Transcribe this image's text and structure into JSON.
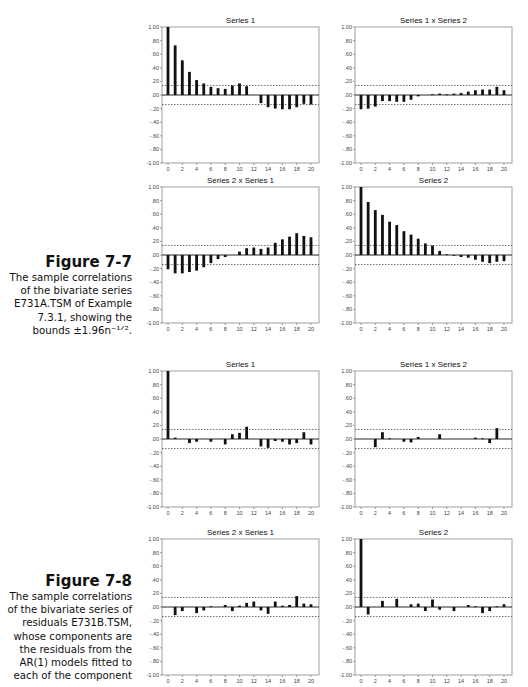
{
  "figures": [
    {
      "label": "Figure 7-7",
      "caption_lines": [
        "The sample correlations",
        "of the bivariate series",
        "E731A.TSM of Example",
        "7.3.1, showing the",
        "bounds ±1.96n⁻¹ᐟ²."
      ],
      "caption_text": "The sample correlations of the bivariate series E731A.TSM of Example 7.3.1, showing the bounds ±1.96n^(-1/2)."
    },
    {
      "label": "Figure 7-8",
      "caption_lines": [
        "The sample correlations",
        "of the bivariate series of",
        "residuals E731B.TSM,",
        "whose components are",
        "the residuals from the",
        "AR(1) models fitted to",
        "each of the component"
      ],
      "caption_text": "The sample correlations of the bivariate series of residuals E731B.TSM, whose components are the residuals from the AR(1) models fitted to each of the component"
    }
  ],
  "axis": {
    "y_ticks": [
      1.0,
      0.8,
      0.6,
      0.4,
      0.2,
      0.0,
      -0.2,
      -0.4,
      -0.6,
      -0.8,
      -1.0
    ],
    "y_tick_labels": [
      "1.00",
      ".80",
      ".60",
      ".40",
      ".20",
      ".00",
      "-.20",
      "-.40",
      "-.60",
      "-.80",
      "-1.00"
    ],
    "x_ticks": [
      0,
      2,
      4,
      6,
      8,
      10,
      12,
      14,
      16,
      18,
      20
    ]
  },
  "chart_data": [
    {
      "type": "bar",
      "figure": "Figure 7-7",
      "title": "Series 1",
      "xlabel": "lag",
      "ylabel": "correlation",
      "ylim": [
        -1,
        1
      ],
      "xlim": [
        0,
        20
      ],
      "bounds": 0.14,
      "x": [
        0,
        1,
        2,
        3,
        4,
        5,
        6,
        7,
        8,
        9,
        10,
        11,
        12,
        13,
        14,
        15,
        16,
        17,
        18,
        19,
        20
      ],
      "values": [
        1.0,
        0.73,
        0.51,
        0.34,
        0.22,
        0.17,
        0.12,
        0.1,
        0.09,
        0.14,
        0.17,
        0.13,
        0.0,
        -0.12,
        -0.18,
        -0.2,
        -0.21,
        -0.21,
        -0.18,
        -0.13,
        -0.14
      ]
    },
    {
      "type": "bar",
      "figure": "Figure 7-7",
      "title": "Series 1 x Series 2",
      "xlabel": "lag",
      "ylabel": "correlation",
      "ylim": [
        -1,
        1
      ],
      "xlim": [
        0,
        20
      ],
      "bounds": 0.14,
      "x": [
        0,
        1,
        2,
        3,
        4,
        5,
        6,
        7,
        8,
        9,
        10,
        11,
        12,
        13,
        14,
        15,
        16,
        17,
        18,
        19,
        20
      ],
      "values": [
        -0.21,
        -0.2,
        -0.17,
        -0.09,
        -0.09,
        -0.1,
        -0.1,
        -0.07,
        -0.02,
        0.0,
        0.01,
        0.02,
        0.01,
        0.02,
        0.03,
        0.05,
        0.07,
        0.08,
        0.08,
        0.12,
        0.07
      ]
    },
    {
      "type": "bar",
      "figure": "Figure 7-7",
      "title": "Series 2 x Series 1",
      "xlabel": "lag",
      "ylabel": "correlation",
      "ylim": [
        -1,
        1
      ],
      "xlim": [
        0,
        20
      ],
      "bounds": 0.14,
      "x": [
        0,
        1,
        2,
        3,
        4,
        5,
        6,
        7,
        8,
        9,
        10,
        11,
        12,
        13,
        14,
        15,
        16,
        17,
        18,
        19,
        20
      ],
      "values": [
        -0.21,
        -0.27,
        -0.27,
        -0.25,
        -0.23,
        -0.18,
        -0.12,
        -0.06,
        -0.03,
        0.0,
        0.05,
        0.1,
        0.11,
        0.09,
        0.11,
        0.18,
        0.23,
        0.27,
        0.32,
        0.28,
        0.26
      ]
    },
    {
      "type": "bar",
      "figure": "Figure 7-7",
      "title": "Series 2",
      "xlabel": "lag",
      "ylabel": "correlation",
      "ylim": [
        -1,
        1
      ],
      "xlim": [
        0,
        20
      ],
      "bounds": 0.14,
      "x": [
        0,
        1,
        2,
        3,
        4,
        5,
        6,
        7,
        8,
        9,
        10,
        11,
        12,
        13,
        14,
        15,
        16,
        17,
        18,
        19,
        20
      ],
      "values": [
        1.0,
        0.78,
        0.66,
        0.59,
        0.49,
        0.44,
        0.35,
        0.3,
        0.24,
        0.17,
        0.14,
        0.06,
        0.01,
        -0.01,
        -0.03,
        -0.04,
        -0.07,
        -0.1,
        -0.12,
        -0.1,
        -0.09
      ]
    },
    {
      "type": "bar",
      "figure": "Figure 7-8",
      "title": "Series 1",
      "xlabel": "lag",
      "ylabel": "correlation",
      "ylim": [
        -1,
        1
      ],
      "xlim": [
        0,
        20
      ],
      "bounds": 0.14,
      "x": [
        0,
        1,
        2,
        3,
        4,
        5,
        6,
        7,
        8,
        9,
        10,
        11,
        12,
        13,
        14,
        15,
        16,
        17,
        18,
        19,
        20
      ],
      "values": [
        1.0,
        0.02,
        0.0,
        -0.06,
        -0.04,
        0.0,
        -0.04,
        0.0,
        -0.08,
        0.07,
        0.09,
        0.18,
        0.0,
        -0.11,
        -0.13,
        -0.03,
        -0.04,
        -0.08,
        -0.06,
        0.1,
        -0.08
      ]
    },
    {
      "type": "bar",
      "figure": "Figure 7-8",
      "title": "Series 1 x Series 2",
      "xlabel": "lag",
      "ylabel": "correlation",
      "ylim": [
        -1,
        1
      ],
      "xlim": [
        0,
        20
      ],
      "bounds": 0.14,
      "x": [
        0,
        1,
        2,
        3,
        4,
        5,
        6,
        7,
        8,
        9,
        10,
        11,
        12,
        13,
        14,
        15,
        16,
        17,
        18,
        19,
        20
      ],
      "values": [
        0.0,
        0.0,
        -0.12,
        0.1,
        0.01,
        0.0,
        -0.04,
        -0.05,
        0.03,
        0.0,
        0.0,
        0.07,
        0.0,
        0.0,
        0.0,
        0.0,
        0.02,
        0.01,
        -0.06,
        0.16,
        0.0
      ]
    },
    {
      "type": "bar",
      "figure": "Figure 7-8",
      "title": "Series 2 x Series 1",
      "xlabel": "lag",
      "ylabel": "correlation",
      "ylim": [
        -1,
        1
      ],
      "xlim": [
        0,
        20
      ],
      "bounds": 0.14,
      "x": [
        0,
        1,
        2,
        3,
        4,
        5,
        6,
        7,
        8,
        9,
        10,
        11,
        12,
        13,
        14,
        15,
        16,
        17,
        18,
        19,
        20
      ],
      "values": [
        0.0,
        -0.12,
        -0.06,
        0.0,
        -0.09,
        -0.05,
        0.01,
        0.0,
        0.03,
        -0.06,
        0.02,
        0.06,
        0.08,
        -0.05,
        -0.1,
        0.08,
        0.02,
        0.03,
        0.16,
        0.05,
        0.04
      ]
    },
    {
      "type": "bar",
      "figure": "Figure 7-8",
      "title": "Series 2",
      "xlabel": "lag",
      "ylabel": "correlation",
      "ylim": [
        -1,
        1
      ],
      "xlim": [
        0,
        20
      ],
      "bounds": 0.14,
      "x": [
        0,
        1,
        2,
        3,
        4,
        5,
        6,
        7,
        8,
        9,
        10,
        11,
        12,
        13,
        14,
        15,
        16,
        17,
        18,
        19,
        20
      ],
      "values": [
        1.0,
        -0.11,
        0.0,
        0.09,
        0.0,
        0.12,
        0.0,
        0.04,
        0.05,
        -0.06,
        0.11,
        -0.04,
        0.0,
        -0.06,
        0.0,
        0.03,
        0.01,
        -0.09,
        -0.06,
        0.01,
        0.04
      ]
    }
  ]
}
